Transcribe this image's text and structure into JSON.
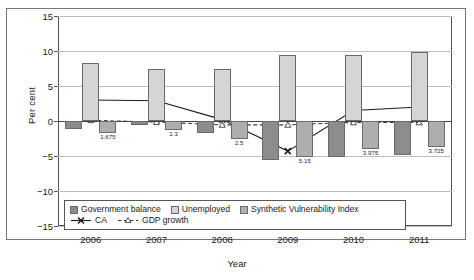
{
  "chart_data": {
    "type": "bar",
    "title": "",
    "xlabel": "Year",
    "ylabel": "Per cent",
    "ylim": [
      -15,
      15
    ],
    "yticks": [
      15,
      10,
      5,
      0,
      -5,
      -10,
      -15
    ],
    "ytick_labels": [
      "15",
      "10",
      "5",
      "0",
      "−5",
      "−10",
      "−15"
    ],
    "grid": true,
    "legend_position": "lower-left-inside",
    "categories": [
      "2006",
      "2007",
      "2008",
      "2009",
      "2010",
      "2011"
    ],
    "series": [
      {
        "name": "Government balance",
        "kind": "bar",
        "color": "#8c8c8c",
        "values": [
          -1.2,
          -0.5,
          -1.7,
          -5.5,
          -5.2,
          -4.8
        ]
      },
      {
        "name": "Unemployed",
        "kind": "bar",
        "color": "#d5d5d5",
        "values": [
          8.3,
          7.5,
          7.5,
          9.4,
          9.5,
          9.9
        ]
      },
      {
        "name": "Synthetic Vulnerability Index",
        "kind": "bar",
        "color": "#aeaeae",
        "values": [
          -1.675,
          -1.3,
          -2.5,
          -5.15,
          -3.975,
          -3.725
        ],
        "data_labels": [
          "1.675",
          "1.3",
          "2.5",
          "5.15",
          "3.975",
          "3.725"
        ]
      },
      {
        "name": "CA",
        "kind": "line",
        "color": "#1a1a1a",
        "marker": "x",
        "dash": "solid",
        "values": [
          3.0,
          2.9,
          0.2,
          -4.3,
          1.5,
          2.0
        ]
      },
      {
        "name": "GDP growth",
        "kind": "line",
        "color": "#3a3a3a",
        "marker": "triangle",
        "dash": "dashed",
        "values": [
          0.1,
          -0.15,
          -0.55,
          -0.55,
          -0.2,
          -0.2
        ]
      }
    ],
    "legend_entries": [
      {
        "label": "Government balance",
        "type": "swatch",
        "color": "#8c8c8c"
      },
      {
        "label": "Unemployed",
        "type": "swatch",
        "color": "#d5d5d5"
      },
      {
        "label": "Synthetic Vulnerability Index",
        "type": "swatch",
        "color": "#aeaeae"
      },
      {
        "label": "CA",
        "type": "line-solid-x",
        "color": "#1a1a1a"
      },
      {
        "label": "GDP growth",
        "type": "line-dashed-triangle",
        "color": "#3a3a3a"
      }
    ]
  }
}
